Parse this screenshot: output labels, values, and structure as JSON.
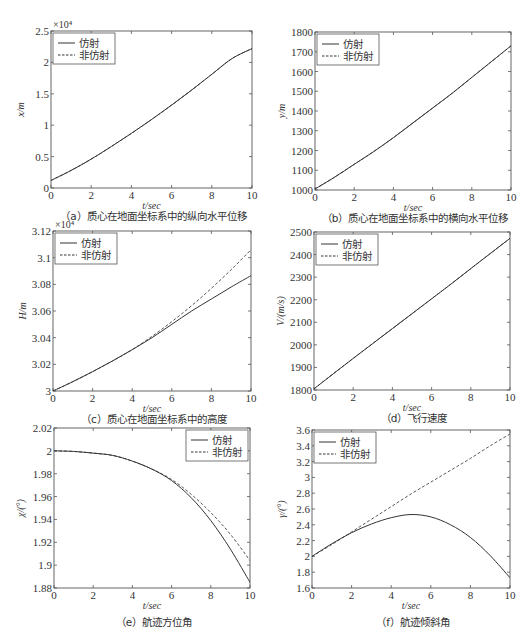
{
  "legend": {
    "solid": "仿射",
    "dashed": "非仿射"
  },
  "chart_data": [
    {
      "id": "a",
      "type": "line",
      "title": "",
      "caption": "（a）质心在地面坐标系中的纵向水平位移",
      "xlabel": "t/sec",
      "ylabel": "x/m",
      "y_exponent": "×10⁴",
      "xlim": [
        0,
        10
      ],
      "ylim": [
        0,
        2.5
      ],
      "xticks": [
        0,
        2,
        4,
        6,
        8,
        10
      ],
      "xtick_labels": [
        "0",
        "2",
        "4",
        "6",
        "8",
        "10"
      ],
      "yticks": [
        0,
        0.5,
        1,
        1.5,
        2,
        2.5
      ],
      "ytick_labels": [
        "0",
        "0.5",
        "1",
        "1.5",
        "2",
        "2.5"
      ],
      "grid": false,
      "legend_position": "upper left",
      "box": [
        51,
        31,
        252,
        188
      ],
      "x": [
        0,
        1,
        2,
        3,
        4,
        5,
        6,
        7,
        8,
        9,
        10
      ],
      "series": [
        {
          "name": "仿射",
          "style": "solid",
          "values": [
            0.12,
            0.28,
            0.46,
            0.66,
            0.87,
            1.09,
            1.32,
            1.56,
            1.81,
            2.06,
            2.22
          ]
        },
        {
          "name": "非仿射",
          "style": "dashed",
          "values": [
            0.12,
            0.28,
            0.46,
            0.66,
            0.87,
            1.09,
            1.32,
            1.56,
            1.81,
            2.06,
            2.22
          ]
        }
      ]
    },
    {
      "id": "b",
      "type": "line",
      "title": "",
      "caption": "（b）质心在地面坐标系中的横向水平位移",
      "xlabel": "t/sec",
      "ylabel": "y/m",
      "y_exponent": "",
      "xlim": [
        0,
        10
      ],
      "ylim": [
        1000,
        1800
      ],
      "xticks": [
        0,
        2,
        4,
        6,
        8,
        10
      ],
      "xtick_labels": [
        "0",
        "2",
        "4",
        "6",
        "8",
        "10"
      ],
      "yticks": [
        1000,
        1100,
        1200,
        1300,
        1400,
        1500,
        1600,
        1700,
        1800
      ],
      "ytick_labels": [
        "1000",
        "1100",
        "1200",
        "1300",
        "1400",
        "1500",
        "1600",
        "1700",
        "1800"
      ],
      "grid": false,
      "legend_position": "upper left",
      "box": [
        315,
        32,
        511,
        190
      ],
      "x": [
        0,
        1,
        2,
        3,
        4,
        5,
        6,
        7,
        8,
        9,
        10
      ],
      "series": [
        {
          "name": "仿射",
          "style": "solid",
          "values": [
            1005,
            1065,
            1130,
            1195,
            1265,
            1340,
            1415,
            1490,
            1570,
            1650,
            1730
          ]
        },
        {
          "name": "非仿射",
          "style": "dashed",
          "values": [
            1005,
            1065,
            1130,
            1195,
            1265,
            1340,
            1415,
            1490,
            1570,
            1650,
            1730
          ]
        }
      ]
    },
    {
      "id": "c",
      "type": "line",
      "title": "",
      "caption": "（c）质心在地面坐标系中的高度",
      "xlabel": "t/sec",
      "ylabel": "H/m",
      "y_exponent": "×10⁴",
      "xlim": [
        0,
        10
      ],
      "ylim": [
        3.0,
        3.12
      ],
      "xticks": [
        0,
        2,
        4,
        6,
        8,
        10
      ],
      "xtick_labels": [
        "0",
        "2",
        "4",
        "6",
        "8",
        "10"
      ],
      "yticks": [
        3.0,
        3.02,
        3.04,
        3.06,
        3.08,
        3.1,
        3.12
      ],
      "ytick_labels": [
        "3",
        "3.02",
        "3.04",
        "3.06",
        "3.08",
        "3.1",
        "3.12"
      ],
      "grid": false,
      "legend_position": "upper left",
      "box": [
        53,
        231,
        251,
        391
      ],
      "x": [
        0,
        1,
        2,
        3,
        4,
        5,
        6,
        7,
        8,
        9,
        10
      ],
      "series": [
        {
          "name": "仿射",
          "style": "solid",
          "values": [
            3.0,
            3.007,
            3.0145,
            3.0225,
            3.031,
            3.04,
            3.05,
            3.06,
            3.069,
            3.078,
            3.0865
          ]
        },
        {
          "name": "非仿射",
          "style": "dashed",
          "values": [
            3.0,
            3.007,
            3.0145,
            3.0225,
            3.031,
            3.041,
            3.052,
            3.064,
            3.077,
            3.091,
            3.106
          ]
        }
      ]
    },
    {
      "id": "d",
      "type": "line",
      "title": "",
      "caption": "（d）飞行速度",
      "xlabel": "t/sec",
      "ylabel": "V/(m/s)",
      "y_exponent": "",
      "xlim": [
        0,
        10
      ],
      "ylim": [
        1800,
        2500
      ],
      "xticks": [
        0,
        2,
        4,
        6,
        8,
        10
      ],
      "xtick_labels": [
        "0",
        "2",
        "4",
        "6",
        "8",
        "10"
      ],
      "yticks": [
        1800,
        1900,
        2000,
        2100,
        2200,
        2300,
        2400,
        2500
      ],
      "ytick_labels": [
        "1800",
        "1900",
        "2000",
        "2100",
        "2200",
        "2300",
        "2400",
        "2500"
      ],
      "grid": false,
      "legend_position": "upper left",
      "box": [
        314,
        232,
        510,
        390
      ],
      "x": [
        0,
        1,
        2,
        3,
        4,
        5,
        6,
        7,
        8,
        9,
        10
      ],
      "series": [
        {
          "name": "仿射",
          "style": "solid",
          "values": [
            1805,
            1873,
            1940,
            2006,
            2072,
            2138,
            2204,
            2270,
            2338,
            2405,
            2472
          ]
        },
        {
          "name": "非仿射",
          "style": "dashed",
          "values": [
            1805,
            1873,
            1940,
            2006,
            2072,
            2138,
            2204,
            2270,
            2338,
            2405,
            2472
          ]
        }
      ]
    },
    {
      "id": "e",
      "type": "line",
      "title": "",
      "caption": "（e）航迹方位角",
      "xlabel": "t/sec",
      "ylabel": "χ/(°)",
      "y_exponent": "",
      "xlim": [
        0,
        10
      ],
      "ylim": [
        1.88,
        2.02
      ],
      "xticks": [
        0,
        2,
        4,
        6,
        8,
        10
      ],
      "xtick_labels": [
        "0",
        "2",
        "4",
        "6",
        "8",
        "10"
      ],
      "yticks": [
        1.88,
        1.9,
        1.92,
        1.94,
        1.96,
        1.98,
        2.0,
        2.02
      ],
      "ytick_labels": [
        "1.88",
        "1.9",
        "1.92",
        "1.94",
        "1.96",
        "1.98",
        "2",
        "2.02"
      ],
      "grid": false,
      "legend_position": "upper right",
      "box": [
        54,
        428,
        250,
        588
      ],
      "x": [
        0,
        1,
        2,
        3,
        4,
        5,
        6,
        7,
        8,
        9,
        10
      ],
      "series": [
        {
          "name": "仿射",
          "style": "solid",
          "values": [
            2.0,
            1.9995,
            1.998,
            1.996,
            1.991,
            1.984,
            1.974,
            1.959,
            1.939,
            1.914,
            1.885
          ]
        },
        {
          "name": "非仿射",
          "style": "dashed",
          "values": [
            2.0,
            1.9995,
            1.998,
            1.996,
            1.991,
            1.984,
            1.975,
            1.962,
            1.946,
            1.927,
            1.904
          ]
        }
      ]
    },
    {
      "id": "f",
      "type": "line",
      "title": "",
      "caption": "（f）航迹倾斜角",
      "xlabel": "t/sec",
      "ylabel": "γ/(°)",
      "y_exponent": "",
      "xlim": [
        0,
        10
      ],
      "ylim": [
        1.6,
        3.6
      ],
      "xticks": [
        0,
        2,
        4,
        6,
        8,
        10
      ],
      "xtick_labels": [
        "0",
        "2",
        "4",
        "6",
        "8",
        "10"
      ],
      "yticks": [
        1.6,
        1.8,
        2.0,
        2.2,
        2.4,
        2.6,
        2.8,
        3.0,
        3.2,
        3.4,
        3.6
      ],
      "ytick_labels": [
        "1.6",
        "1.8",
        "2",
        "2.2",
        "2.4",
        "2.6",
        "2.8",
        "3",
        "3.2",
        "3.4",
        "3.6"
      ],
      "grid": false,
      "legend_position": "upper left",
      "box": [
        312,
        430,
        510,
        588
      ],
      "x": [
        0,
        1,
        2,
        3,
        4,
        5,
        6,
        7,
        8,
        9,
        10
      ],
      "series": [
        {
          "name": "仿射",
          "style": "solid",
          "values": [
            2.0,
            2.16,
            2.3,
            2.41,
            2.49,
            2.53,
            2.5,
            2.4,
            2.24,
            2.01,
            1.73
          ]
        },
        {
          "name": "非仿射",
          "style": "dashed",
          "values": [
            2.0,
            2.15,
            2.31,
            2.47,
            2.63,
            2.79,
            2.94,
            3.09,
            3.24,
            3.4,
            3.55
          ]
        }
      ]
    }
  ]
}
